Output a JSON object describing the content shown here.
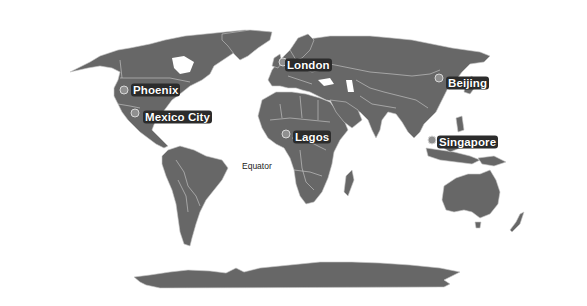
{
  "map": {
    "projection": "world-map",
    "land_color": "#676767",
    "border_color": "#cfcfcf",
    "background_color": "#ffffff",
    "marker_color": "#8f8f8f",
    "label_background": "#2c2c2c",
    "label_text_color": "#ffffff"
  },
  "annotations": {
    "equator_label": "Equator"
  },
  "cities": [
    {
      "name": "Phoenix",
      "marker": {
        "x": 124,
        "y": 90
      },
      "label": {
        "x": 131,
        "y": 90
      }
    },
    {
      "name": "Mexico City",
      "marker": {
        "x": 135,
        "y": 113
      },
      "label": {
        "x": 143,
        "y": 117
      }
    },
    {
      "name": "London",
      "marker": {
        "x": 283,
        "y": 62
      },
      "label": {
        "x": 285,
        "y": 65
      }
    },
    {
      "name": "Beijing",
      "marker": {
        "x": 439,
        "y": 78
      },
      "label": {
        "x": 446,
        "y": 83
      }
    },
    {
      "name": "Lagos",
      "marker": {
        "x": 286,
        "y": 134
      },
      "label": {
        "x": 293,
        "y": 137
      }
    },
    {
      "name": "Singapore",
      "marker": {
        "x": 432,
        "y": 140
      },
      "label": {
        "x": 437,
        "y": 142
      }
    }
  ]
}
